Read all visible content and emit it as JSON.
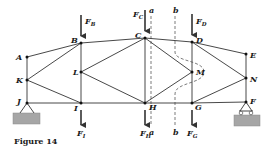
{
  "figure": {
    "caption": "Figure 14",
    "type": "truss",
    "colors": {
      "member": "#333333",
      "support": "#9a9a9a",
      "section": "#444444"
    }
  },
  "joints": [
    {
      "id": "A",
      "x": 27,
      "y": 57
    },
    {
      "id": "B",
      "x": 81,
      "y": 43
    },
    {
      "id": "C",
      "x": 145,
      "y": 38
    },
    {
      "id": "D",
      "x": 192,
      "y": 42
    },
    {
      "id": "E",
      "x": 246,
      "y": 54
    },
    {
      "id": "K",
      "x": 27,
      "y": 80
    },
    {
      "id": "L",
      "x": 81,
      "y": 72
    },
    {
      "id": "M",
      "x": 192,
      "y": 72
    },
    {
      "id": "N",
      "x": 246,
      "y": 78
    },
    {
      "id": "J",
      "x": 27,
      "y": 103
    },
    {
      "id": "I",
      "x": 81,
      "y": 103
    },
    {
      "id": "H",
      "x": 145,
      "y": 103
    },
    {
      "id": "G",
      "x": 192,
      "y": 103
    },
    {
      "id": "F",
      "x": 246,
      "y": 102
    }
  ],
  "members": [
    [
      "A",
      "B"
    ],
    [
      "B",
      "C"
    ],
    [
      "C",
      "D"
    ],
    [
      "D",
      "E"
    ],
    [
      "J",
      "I"
    ],
    [
      "I",
      "H"
    ],
    [
      "H",
      "G"
    ],
    [
      "G",
      "F"
    ],
    [
      "A",
      "K"
    ],
    [
      "K",
      "J"
    ],
    [
      "E",
      "N"
    ],
    [
      "N",
      "F"
    ],
    [
      "B",
      "L"
    ],
    [
      "L",
      "I"
    ],
    [
      "C",
      "H"
    ],
    [
      "D",
      "M"
    ],
    [
      "M",
      "G"
    ],
    [
      "K",
      "B"
    ],
    [
      "K",
      "I"
    ],
    [
      "L",
      "C"
    ],
    [
      "L",
      "H"
    ],
    [
      "C",
      "M"
    ],
    [
      "M",
      "H"
    ],
    [
      "D",
      "N"
    ],
    [
      "N",
      "G"
    ]
  ],
  "loads": [
    {
      "label": "F",
      "sub": "B",
      "joint": "B",
      "direction": "down",
      "position": "above"
    },
    {
      "label": "F",
      "sub": "C",
      "joint": "C",
      "direction": "down",
      "position": "above"
    },
    {
      "label": "F",
      "sub": "D",
      "joint": "D",
      "direction": "down",
      "position": "above"
    },
    {
      "label": "F",
      "sub": "I",
      "joint": "I",
      "direction": "down",
      "position": "below"
    },
    {
      "label": "F",
      "sub": "H",
      "joint": "H",
      "direction": "down",
      "position": "below"
    },
    {
      "label": "F",
      "sub": "G",
      "joint": "G",
      "direction": "down",
      "position": "below"
    }
  ],
  "sections": [
    {
      "label": "a",
      "style": "straight-dashed"
    },
    {
      "label": "b",
      "style": "curved-dashed"
    }
  ],
  "supports": [
    {
      "joint": "J",
      "type": "pin"
    },
    {
      "joint": "F",
      "type": "roller"
    }
  ]
}
